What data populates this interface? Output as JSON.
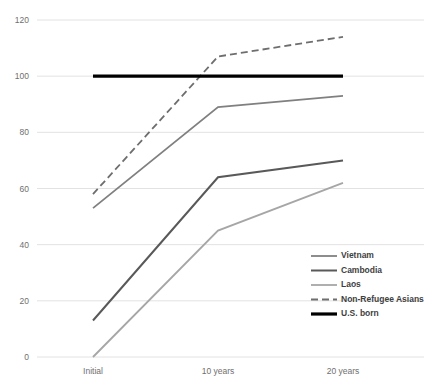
{
  "chart_data": {
    "type": "line",
    "title": "",
    "subtitle": "",
    "xlabel": "",
    "ylabel": "",
    "categories": [
      "Initial",
      "10 years",
      "20 years"
    ],
    "x_tick_labels": [
      "Initial",
      "10 years",
      "20 years"
    ],
    "y_tick_labels": [
      "0",
      "20",
      "40",
      "60",
      "80",
      "100",
      "120"
    ],
    "y_ticks": [
      0,
      20,
      40,
      60,
      80,
      100,
      120
    ],
    "ylim": [
      0,
      120
    ],
    "grid": "horizontal",
    "legend_position": "inside-lower-right",
    "series": [
      {
        "name": "Vietnam",
        "values": [
          53,
          89,
          93
        ],
        "color": "#808080",
        "style": "solid",
        "width": 1.8
      },
      {
        "name": "Cambodia",
        "values": [
          13,
          64,
          70
        ],
        "color": "#595959",
        "style": "solid",
        "width": 2.0
      },
      {
        "name": "Laos",
        "values": [
          0,
          45,
          62
        ],
        "color": "#a6a6a6",
        "style": "solid",
        "width": 1.8
      },
      {
        "name": "Non-Refugee Asians",
        "values": [
          58,
          107,
          114
        ],
        "color": "#6e6e6e",
        "style": "dashed",
        "width": 1.8
      },
      {
        "name": "U.S. born",
        "values": [
          100,
          100,
          100
        ],
        "color": "#000000",
        "style": "solid",
        "width": 3.2
      }
    ]
  },
  "legend": {
    "items": [
      {
        "label": "Vietnam"
      },
      {
        "label": "Cambodia"
      },
      {
        "label": "Laos"
      },
      {
        "label": "Non-Refugee Asians"
      },
      {
        "label": "U.S. born"
      }
    ]
  },
  "axes": {
    "y_labels": [
      "120",
      "100",
      "80",
      "60",
      "40",
      "20",
      "0"
    ],
    "x_labels": [
      "Initial",
      "10 years",
      "20 years"
    ]
  }
}
